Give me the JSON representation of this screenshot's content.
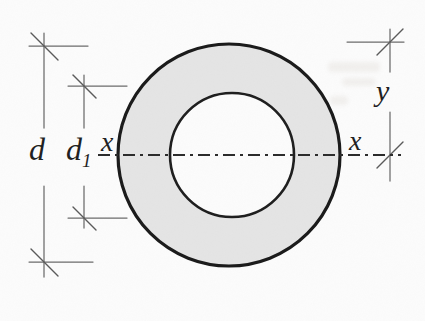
{
  "figure": {
    "type": "engineering-cross-section-diagram",
    "labels": {
      "outer_diameter": "d",
      "inner_diameter_base": "d",
      "inner_diameter_sub": "1",
      "axis_left": "x",
      "axis_right": "x",
      "vertical_distance": "y"
    },
    "colors": {
      "background": "#fcfcfc",
      "ring_fill": "#e5e5e5",
      "inner_hole_fill": "#fcfcfc",
      "outline": "#1a1a1a",
      "dimension_lines": "#6b6b6b",
      "centerline": "#2b2b2b",
      "label_text": "#1f1f1f"
    }
  }
}
